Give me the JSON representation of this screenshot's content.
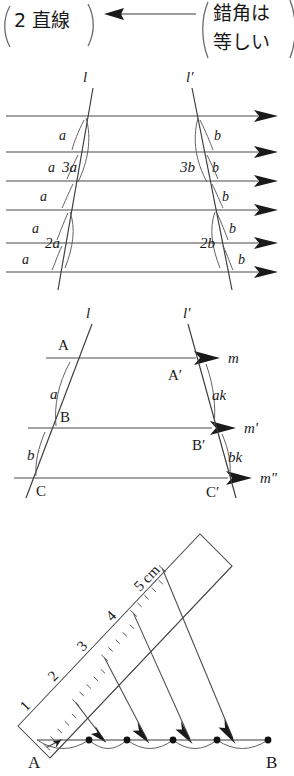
{
  "page": {
    "width": 294,
    "height": 776,
    "ink_color": "#1a1a1a",
    "line_color": "#4a4a4a"
  },
  "banner": {
    "left_bubble": "2 直線",
    "right_bubble_line1": "錯角は",
    "right_bubble_line2": "等しい",
    "arrow": "leftwards-arrow"
  },
  "figure1": {
    "caption": "",
    "transversal_left_label": "l",
    "transversal_right_label": "l′",
    "left_angle_labels": [
      "a",
      "a",
      "3a",
      "a",
      "a",
      "2a",
      "a"
    ],
    "right_angle_labels": [
      "b",
      "3b",
      "b",
      "b",
      "b",
      "2b",
      "b"
    ],
    "parallel_line_count": 6,
    "arrow_direction": "right"
  },
  "figure2": {
    "transversal_left_label": "l",
    "transversal_right_label": "l′",
    "points_left": [
      "A",
      "B",
      "C"
    ],
    "points_right": [
      "A′",
      "B′",
      "C′"
    ],
    "line_labels": [
      "m",
      "m′",
      "m″"
    ],
    "angle_left": [
      "a",
      "b"
    ],
    "angle_right": [
      "ak",
      "bk"
    ],
    "arrow_direction": "right"
  },
  "figure3": {
    "endpoint_left": "A",
    "endpoint_right": "B",
    "ruler_marks": [
      "1",
      "2",
      "3",
      "4",
      "5 cm"
    ],
    "division_count": 5,
    "arrow_direction": "down-right",
    "arc_count": 5
  }
}
